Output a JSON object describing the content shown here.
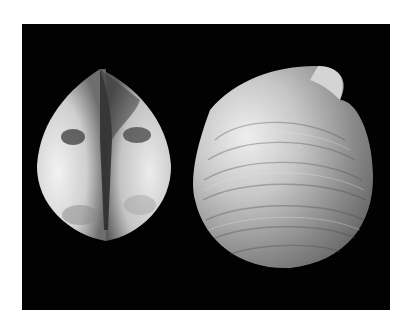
{
  "image": {
    "description": "Photograph of two bivalve clam shells on a black background",
    "background_color": "#020202",
    "page_color": "#ffffff",
    "subjects": [
      {
        "name": "left-shell",
        "view": "dorsal/hinge view showing both valves",
        "dominant_color": "#d8d8d8"
      },
      {
        "name": "right-shell",
        "view": "lateral view of single valve with concentric growth lines",
        "dominant_color": "#a9a9a9"
      }
    ]
  }
}
